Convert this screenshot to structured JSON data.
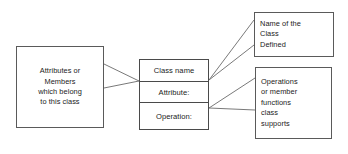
{
  "diagram": {
    "kind": "uml-class-diagram-annotated",
    "background_color": "#ffffff",
    "line_color": "#5a5a5a",
    "text_color": "#1b1b1b",
    "class_box": {
      "name_label": "Class name",
      "attribute_label": "Attribute:",
      "operation_label": "Operation:"
    },
    "annotations": {
      "left_note": {
        "lines": [
          "Attributes or",
          "Members",
          "which belong",
          "to this class"
        ],
        "align": "center"
      },
      "top_right_note": {
        "lines": [
          "Name of the",
          "Class",
          "Defined"
        ],
        "align": "left"
      },
      "bottom_right_note": {
        "lines": [
          "Operations",
          "or member",
          "functions",
          "class",
          "supports"
        ],
        "align": "left"
      }
    }
  }
}
